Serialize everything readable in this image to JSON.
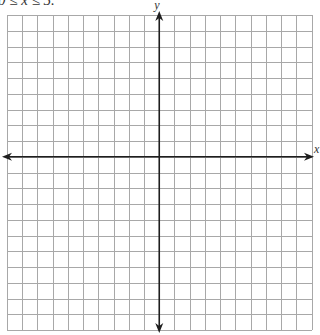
{
  "header": {
    "clipped_text": "0 ≤ x ≤ 5."
  },
  "graph": {
    "type": "coordinate-grid",
    "x_axis_label": "x",
    "y_axis_label": "y",
    "columns_left_of_y_axis": 10,
    "columns_right_of_y_axis": 10,
    "rows_above_x_axis": 9,
    "rows_below_x_axis": 11,
    "grid_color": "#a8a8a8",
    "axis_color": "#1e1e1e",
    "arrows": [
      "left",
      "right",
      "up",
      "down"
    ]
  }
}
